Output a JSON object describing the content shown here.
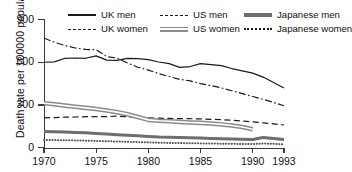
{
  "chart_data": {
    "type": "line",
    "title": "",
    "xlabel": "",
    "ylabel": "Death rate per 100000 population",
    "xlim": [
      1970,
      1993
    ],
    "ylim": [
      0,
      900
    ],
    "yticks": [
      0,
      300,
      600,
      900
    ],
    "xticks": [
      1970,
      1975,
      1980,
      1985,
      1990,
      1993
    ],
    "grid": false,
    "legend_position": "top",
    "series": [
      {
        "name": "UK men",
        "style": "solid",
        "color": "#1a1a1a",
        "x": [
          1970,
          1971,
          1972,
          1973,
          1974,
          1975,
          1976,
          1977,
          1978,
          1979,
          1980,
          1981,
          1982,
          1983,
          1984,
          1985,
          1986,
          1987,
          1988,
          1989,
          1990,
          1991,
          1992,
          1993
        ],
        "values": [
          600,
          603,
          628,
          630,
          628,
          645,
          615,
          613,
          627,
          625,
          618,
          602,
          590,
          564,
          570,
          590,
          583,
          576,
          556,
          540,
          524,
          496,
          458,
          420
        ]
      },
      {
        "name": "UK women",
        "style": "dashed",
        "color": "#1a1a1a",
        "x": [
          1970,
          1971,
          1972,
          1973,
          1974,
          1975,
          1976,
          1977,
          1978,
          1979,
          1980,
          1981,
          1982,
          1983,
          1984,
          1985,
          1986,
          1987,
          1988,
          1989,
          1990,
          1991,
          1992,
          1993
        ],
        "values": [
          210,
          212,
          215,
          216,
          218,
          219,
          218,
          222,
          218,
          214,
          210,
          208,
          206,
          205,
          204,
          203,
          200,
          198,
          193,
          188,
          182,
          175,
          168,
          160
        ]
      },
      {
        "name": "US men",
        "style": "dashdot",
        "color": "#1a1a1a",
        "x": [
          1970,
          1971,
          1972,
          1973,
          1974,
          1975,
          1976,
          1977,
          1978,
          1979,
          1980,
          1981,
          1982,
          1983,
          1984,
          1985,
          1986,
          1987,
          1988,
          1989,
          1990,
          1991,
          1992,
          1993
        ],
        "values": [
          770,
          740,
          718,
          700,
          690,
          688,
          640,
          630,
          595,
          565,
          545,
          520,
          500,
          480,
          470,
          450,
          437,
          420,
          400,
          380,
          360,
          340,
          318,
          295
        ]
      },
      {
        "name": "US women",
        "style": "band",
        "color": "#8a8a8a",
        "x": [
          1970,
          1971,
          1972,
          1973,
          1974,
          1975,
          1976,
          1977,
          1978,
          1979,
          1980,
          1981,
          1982,
          1983,
          1984,
          1985,
          1986,
          1987,
          1988,
          1989,
          1990
        ],
        "values": [
          312,
          305,
          296,
          288,
          280,
          272,
          262,
          250,
          236,
          216,
          196,
          190,
          186,
          182,
          178,
          175,
          170,
          164,
          156,
          146,
          130
        ]
      },
      {
        "name": "Japanese men",
        "style": "thick",
        "color": "#6e6e6e",
        "x": [
          1970,
          1971,
          1972,
          1973,
          1974,
          1975,
          1976,
          1977,
          1978,
          1979,
          1980,
          1981,
          1982,
          1983,
          1984,
          1985,
          1986,
          1987,
          1988,
          1989,
          1990,
          1991,
          1992,
          1993
        ],
        "values": [
          115,
          112,
          110,
          108,
          105,
          100,
          96,
          92,
          88,
          84,
          80,
          76,
          74,
          72,
          70,
          68,
          66,
          64,
          62,
          60,
          58,
          72,
          66,
          58
        ]
      },
      {
        "name": "Japanese women",
        "style": "dotted",
        "color": "#555555",
        "x": [
          1970,
          1971,
          1972,
          1973,
          1974,
          1975,
          1976,
          1977,
          1978,
          1979,
          1980,
          1981,
          1982,
          1983,
          1984,
          1985,
          1986,
          1987,
          1988,
          1989,
          1990,
          1991,
          1992,
          1993
        ],
        "values": [
          55,
          54,
          53,
          52,
          50,
          48,
          46,
          44,
          42,
          40,
          38,
          36,
          34,
          33,
          32,
          31,
          30,
          29,
          28,
          27,
          26,
          30,
          28,
          24
        ]
      }
    ]
  },
  "legend": {
    "items": [
      {
        "label": "UK men",
        "style": "solid"
      },
      {
        "label": "US men",
        "style": "dashdot"
      },
      {
        "label": "Japanese men",
        "style": "thick"
      },
      {
        "label": "UK women",
        "style": "dash"
      },
      {
        "label": "US women",
        "style": "band"
      },
      {
        "label": "Japanese women",
        "style": "dot"
      }
    ]
  },
  "axis": {
    "y_title": "Death rate per 100000 population",
    "y_labels": [
      "900",
      "600",
      "300",
      "0"
    ],
    "x_labels": [
      "1970",
      "1975",
      "1980",
      "1985",
      "1990",
      "1993"
    ]
  }
}
